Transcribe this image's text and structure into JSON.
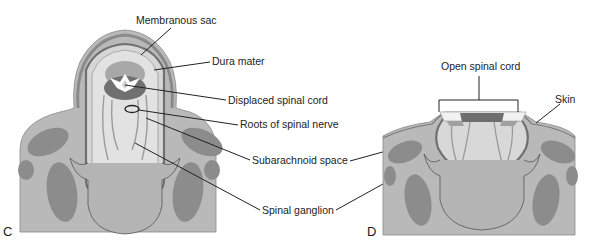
{
  "figure": {
    "panels": [
      {
        "id": "C",
        "label": "C",
        "annotations": [
          {
            "text": "Membranous sac"
          },
          {
            "text": "Dura mater"
          },
          {
            "text": "Displaced spinal cord"
          },
          {
            "text": "Roots of spinal nerve"
          },
          {
            "text": "Subarachnoid space"
          },
          {
            "text": "Spinal ganglion"
          }
        ]
      },
      {
        "id": "D",
        "label": "D",
        "annotations": [
          {
            "text": "Open spinal cord"
          },
          {
            "text": "Skin"
          }
        ]
      }
    ],
    "colors": {
      "tissue": "#b9b9b9",
      "muscle": "#8c8c8c",
      "sac_fill": "#d9d9d9",
      "dura": "#7a7a7a",
      "cord_dark": "#6e6e6e",
      "cord_light": "#a5a5a5",
      "line": "#222222"
    }
  }
}
